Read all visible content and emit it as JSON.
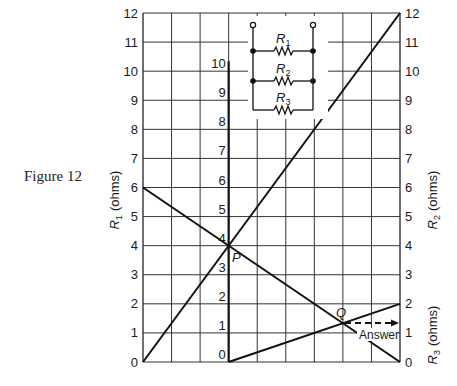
{
  "caption": "Figure 12",
  "chart_data": {
    "type": "line",
    "title": "Figure 12",
    "axes": {
      "left": {
        "label": "R1 (ohms)",
        "label_var": "R",
        "label_sub": "1",
        "label_unit": "(ohms)",
        "ticks": [
          0,
          1,
          2,
          3,
          4,
          5,
          6,
          7,
          8,
          9,
          10,
          11,
          12
        ],
        "range": [
          0,
          12
        ]
      },
      "right_upper": {
        "label": "R2 (ohms)",
        "label_var": "R",
        "label_sub": "2",
        "label_unit": "(ohms)",
        "ticks": [
          0,
          1,
          2,
          3,
          4,
          5,
          6,
          7,
          8,
          9,
          10,
          11,
          12
        ],
        "range": [
          0,
          12
        ]
      },
      "right_lower": {
        "label": "R3 (ohms)",
        "label_var": "R",
        "label_sub": "3",
        "label_unit": "(ohms)"
      },
      "middle": {
        "ticks": [
          0,
          1,
          2,
          3,
          4,
          5,
          6,
          7,
          8,
          9,
          10
        ],
        "range": [
          0,
          10
        ],
        "position_col": 3
      }
    },
    "grid": {
      "columns": 9,
      "rows": 12,
      "on": true
    },
    "series": [
      {
        "name": "R1 line",
        "points": [
          [
            0,
            6
          ],
          [
            9,
            0
          ]
        ],
        "description": "From R1=6 on left axis to 0 on right axis"
      },
      {
        "name": "R2 line",
        "points": [
          [
            0,
            0
          ],
          [
            9,
            12
          ]
        ],
        "description": "From 0 on left axis to R2=12 on right axis"
      },
      {
        "name": "R3 line",
        "points": [
          [
            3,
            0
          ],
          [
            9,
            2
          ]
        ],
        "description": "From 0 on middle axis to R3=2 on right axis"
      }
    ],
    "annotations": [
      {
        "label": "P",
        "x": 3,
        "y": 4,
        "note": "Intersection of R1 and R2 lines on middle axis (value 4)"
      },
      {
        "label": "Q",
        "x": 7,
        "y": 1.33,
        "note": "Intersection of R1-P line with R3 line"
      },
      {
        "label": "Answer",
        "x": 9,
        "y": 1.33,
        "note": "Dashed arrow from Q to right axis"
      }
    ]
  },
  "circuit": {
    "resistors": [
      {
        "label_var": "R",
        "label_sub": "1"
      },
      {
        "label_var": "R",
        "label_sub": "2"
      },
      {
        "label_var": "R",
        "label_sub": "3"
      }
    ]
  },
  "labels": {
    "left_ticks": [
      "0",
      "1",
      "2",
      "3",
      "4",
      "5",
      "6",
      "7",
      "8",
      "9",
      "10",
      "11",
      "12"
    ],
    "right_ticks": [
      "0",
      "1",
      "2",
      "3",
      "4",
      "5",
      "6",
      "7",
      "8",
      "9",
      "10",
      "11",
      "12"
    ],
    "middle_ticks": [
      "0",
      "1",
      "2",
      "3",
      "4",
      "5",
      "6",
      "7",
      "8",
      "9",
      "10"
    ],
    "point_p": "P",
    "point_q": "Q",
    "answer": "Answer"
  }
}
